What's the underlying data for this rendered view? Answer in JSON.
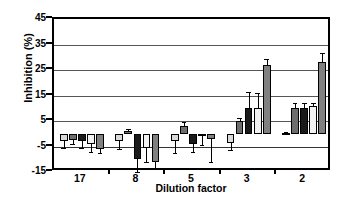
{
  "chart_data": {
    "type": "bar",
    "title": "",
    "xlabel": "Dilution factor",
    "ylabel": "Inhibition (%)",
    "categories": [
      "17",
      "8",
      "5",
      "3",
      "2"
    ],
    "ylim": [
      -15,
      45
    ],
    "yticks": [
      -15,
      -5,
      5,
      15,
      25,
      35,
      45
    ],
    "ytick_labels": [
      "-15",
      "-5",
      "5",
      "15",
      "25",
      "35",
      "45"
    ],
    "grid": true,
    "legend": "none",
    "orientation": "vertical",
    "series": [
      {
        "name": "series-1",
        "color": "#d9d9d9",
        "values": [
          -3.0,
          -3.0,
          -3.0,
          -3.5,
          0.2
        ],
        "errors": [
          2.5,
          3.0,
          4.5,
          3.0,
          0.4
        ]
      },
      {
        "name": "series-2",
        "color": "#6e6e6e",
        "values": [
          -2.5,
          1.0,
          3.0,
          5.0,
          10.0
        ],
        "errors": [
          1.5,
          1.0,
          1.5,
          1.0,
          2.0
        ]
      },
      {
        "name": "series-3",
        "color": "#1a1a1a",
        "values": [
          -3.0,
          -10.0,
          -4.0,
          10.0,
          10.0
        ],
        "errors": [
          2.5,
          5.0,
          3.0,
          6.5,
          2.0
        ]
      },
      {
        "name": "series-4",
        "color": "#f2f2f2",
        "values": [
          -4.0,
          -5.5,
          -0.5,
          10.0,
          11.0
        ],
        "errors": [
          3.0,
          5.5,
          4.0,
          6.0,
          1.0
        ]
      },
      {
        "name": "series-5",
        "color": "#808080",
        "values": [
          -6.0,
          -11.0,
          -2.0,
          27.0,
          28.0
        ],
        "errors": [
          1.5,
          2.5,
          9.0,
          2.5,
          3.5
        ]
      }
    ]
  },
  "axis": {
    "y_title": "Inhibition (%)",
    "x_title": "Dilution factor"
  }
}
